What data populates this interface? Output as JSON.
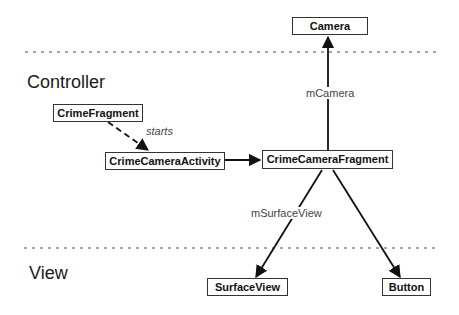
{
  "layers": [
    {
      "id": "controller",
      "label": "Controller"
    },
    {
      "id": "view",
      "label": "View"
    }
  ],
  "nodes": {
    "camera": {
      "label": "Camera"
    },
    "crime_fragment": {
      "label": "CrimeFragment"
    },
    "crime_camera_activity": {
      "label": "CrimeCameraActivity"
    },
    "crime_camera_fragment": {
      "label": "CrimeCameraFragment"
    },
    "surface_view": {
      "label": "SurfaceView"
    },
    "button": {
      "label": "Button"
    }
  },
  "edges": [
    {
      "from": "crime_fragment",
      "to": "crime_camera_activity",
      "label": "starts",
      "style": "dashed"
    },
    {
      "from": "crime_camera_activity",
      "to": "crime_camera_fragment",
      "label": "",
      "style": "solid"
    },
    {
      "from": "crime_camera_fragment",
      "to": "camera",
      "label": "mCamera",
      "style": "solid"
    },
    {
      "from": "crime_camera_fragment",
      "to": "surface_view",
      "label": "mSurfaceView",
      "style": "solid"
    },
    {
      "from": "crime_camera_fragment",
      "to": "button",
      "label": "",
      "style": "solid"
    }
  ],
  "edge_labels": {
    "starts": "starts",
    "mCamera": "mCamera",
    "mSurfaceView": "mSurfaceView"
  },
  "colors": {
    "line": "#111111",
    "divider": "#888888",
    "text": "#1a1a1a"
  }
}
